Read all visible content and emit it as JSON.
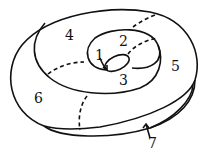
{
  "diagram": {
    "labels": [
      {
        "id": "region-1",
        "text": "1",
        "x": 94,
        "y": 60
      },
      {
        "id": "region-2",
        "text": "2",
        "x": 119,
        "y": 46
      },
      {
        "id": "region-3",
        "text": "3",
        "x": 120,
        "y": 86
      },
      {
        "id": "region-4",
        "text": "4",
        "x": 65,
        "y": 40
      },
      {
        "id": "region-5",
        "text": "5",
        "x": 171,
        "y": 72
      },
      {
        "id": "region-6",
        "text": "6",
        "x": 34,
        "y": 104
      },
      {
        "id": "region-7",
        "text": "7",
        "x": 147,
        "y": 148
      }
    ],
    "colors": {
      "stroke": "#111111",
      "background": "#ffffff"
    }
  }
}
